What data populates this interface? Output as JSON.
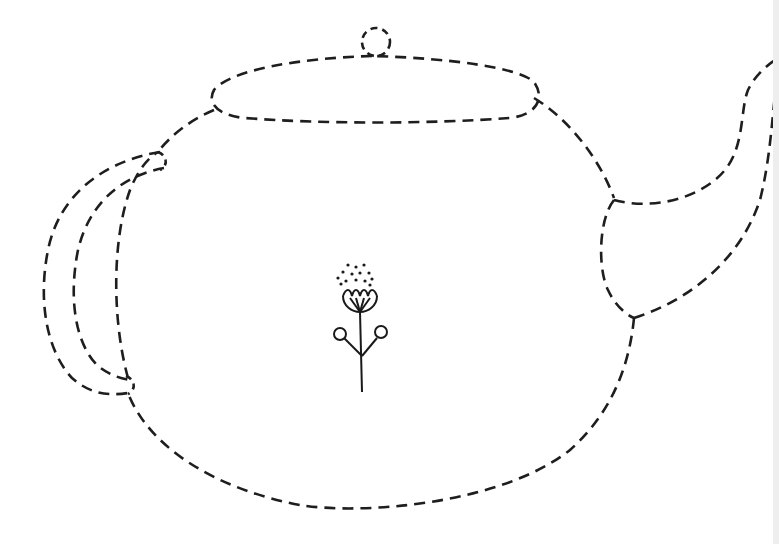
{
  "worksheet": {
    "subject": "teapot tracing outline",
    "style": "dashed-line",
    "colors": {
      "ink": "#1e1e1e",
      "background": "#ffffff"
    },
    "parts": [
      "knob",
      "lid",
      "body",
      "handle",
      "spout",
      "flower-decoration"
    ]
  }
}
